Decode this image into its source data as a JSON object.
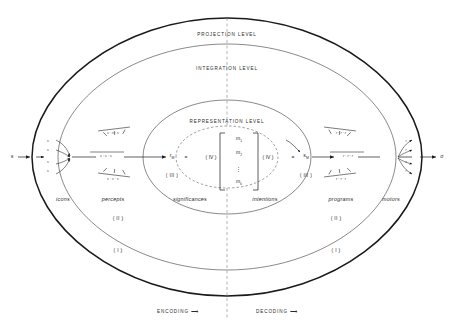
{
  "figure": {
    "background": "#ffffff",
    "ink": "#1a1a1a"
  },
  "levels": [
    {
      "id": "projection",
      "label": "PROJECTION LEVEL",
      "x": 227,
      "y": 36
    },
    {
      "id": "integration",
      "label": "INTEGRATION LEVEL",
      "x": 227,
      "y": 70
    },
    {
      "id": "representation",
      "label": "REPRESENTATION LEVEL",
      "x": 227,
      "y": 123
    }
  ],
  "terms": [
    {
      "id": "icons",
      "label": "icons",
      "x": 63,
      "y": 201
    },
    {
      "id": "percepts",
      "label": "percepts",
      "x": 113,
      "y": 201
    },
    {
      "id": "significances",
      "label": "significances",
      "x": 190,
      "y": 201
    },
    {
      "id": "intentions",
      "label": "intentions",
      "x": 265,
      "y": 201
    },
    {
      "id": "programs",
      "label": "programs",
      "x": 341,
      "y": 201
    },
    {
      "id": "motors",
      "label": "motors",
      "x": 391,
      "y": 201
    }
  ],
  "region_markers": [
    {
      "id": "region-two-left",
      "label": "( II )",
      "x": 118,
      "y": 220
    },
    {
      "id": "region-two-right",
      "label": "( II )",
      "x": 336,
      "y": 220
    },
    {
      "id": "region-one-left",
      "label": "( I )",
      "x": 118,
      "y": 252
    },
    {
      "id": "region-one-right",
      "label": "( I )",
      "x": 336,
      "y": 252
    }
  ],
  "flow": [
    {
      "id": "encoding",
      "label": "ENCODING ⟶",
      "x": 178,
      "y": 313
    },
    {
      "id": "decoding",
      "label": "DECODING ⟶",
      "x": 277,
      "y": 313
    }
  ],
  "io": {
    "input": {
      "id": "stimulus",
      "label": "s",
      "x": 12,
      "y": 157
    },
    "output": {
      "id": "response",
      "label": "σ",
      "x": 442,
      "y": 157
    }
  },
  "central": {
    "left_vector": {
      "id": "r-sub-m",
      "label": "r",
      "sub": "M",
      "x": 172,
      "y": 157
    },
    "right_vector": {
      "id": "s-sub-m",
      "label": "s",
      "sub": "M",
      "x": 306,
      "y": 157
    },
    "left_equals": {
      "id": "equals-left",
      "label": "=",
      "x": 186,
      "y": 157
    },
    "right_equals": {
      "id": "equals-right",
      "label": "=",
      "x": 293,
      "y": 157
    },
    "left_operator": {
      "id": "operator-left",
      "label": "( IV )",
      "x": 211,
      "y": 157
    },
    "right_operator": {
      "id": "operator-right",
      "label": "( IV )",
      "x": 268,
      "y": 157
    },
    "left_roman": {
      "id": "roman-left",
      "label": "( III )",
      "x": 172,
      "y": 176
    },
    "right_roman": {
      "id": "roman-right",
      "label": "( III )",
      "x": 306,
      "y": 176
    },
    "matrix": {
      "id": "message-vector",
      "entries": [
        {
          "id": "m-1",
          "label": "m",
          "sub": "1",
          "x": 239,
          "y": 140
        },
        {
          "id": "m-2",
          "label": "m",
          "sub": "2",
          "x": 239,
          "y": 154
        },
        {
          "id": "m-k",
          "label": "m",
          "sub": "k",
          "x": 239,
          "y": 183
        }
      ],
      "ellipsis": {
        "id": "matrix-ellipsis",
        "label": "⋮",
        "x": 239,
        "y": 169
      }
    }
  },
  "symbol_groups": {
    "left_icons": [
      {
        "id": "icon-s-1",
        "label": "s",
        "x": 48,
        "y": 142
      },
      {
        "id": "icon-s-2",
        "label": "s",
        "x": 48,
        "y": 151
      },
      {
        "id": "icon-s-3",
        "label": "s",
        "x": 48,
        "y": 163
      },
      {
        "id": "icon-s-4",
        "label": "s",
        "x": 48,
        "y": 172
      }
    ],
    "left_percepts_top": {
      "id": "percept-group-top",
      "label": "s · s · s",
      "x": 113,
      "y": 134
    },
    "left_percepts_middle": {
      "id": "percept-group-middle",
      "label": "s · s · s",
      "x": 106,
      "y": 157
    },
    "left_percepts_bottom": {
      "id": "percept-group-bottom",
      "label": "s · s · s",
      "x": 113,
      "y": 180
    },
    "right_programs_top": {
      "id": "program-group-top",
      "label": "r · r · r",
      "x": 341,
      "y": 134
    },
    "right_programs_middle": {
      "id": "program-group-middle",
      "label": "r · r · r",
      "x": 348,
      "y": 157
    },
    "right_programs_bottom": {
      "id": "program-group-bottom",
      "label": "r · r · r",
      "x": 341,
      "y": 180
    },
    "right_motors": [
      {
        "id": "motor-r-1",
        "label": "r",
        "x": 406,
        "y": 142
      },
      {
        "id": "motor-r-2",
        "label": "r",
        "x": 406,
        "y": 151
      },
      {
        "id": "motor-r-3",
        "label": "r",
        "x": 406,
        "y": 163
      },
      {
        "id": "motor-r-4",
        "label": "r",
        "x": 406,
        "y": 172
      }
    ]
  }
}
